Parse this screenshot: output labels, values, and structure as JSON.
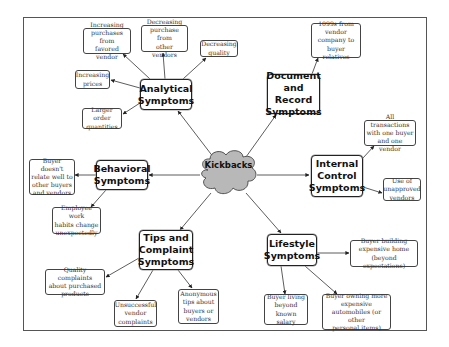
{
  "center": {
    "label": "Kickbacks",
    "fill": "#b8b8b8"
  },
  "categories": {
    "analytical": {
      "label": "Analytical\nSymptoms"
    },
    "document": {
      "label": "Document\nand Record\nSymptoms"
    },
    "internal": {
      "label": "Internal\nControl\nSymptoms"
    },
    "behavioral": {
      "label": "Behavioral\nSymptoms"
    },
    "tips": {
      "label": "Tips and\nComplaint\nSymptoms"
    },
    "lifestyle": {
      "label": "Lifestyle\nSymptoms"
    }
  },
  "leaves": {
    "increasing_purchases": "Increasing\npurchases from\nfavored vendor",
    "decreasing_purchase": "Decreasing\npurchase from\nother vendors",
    "decreasing_quality": "Decreasing\nquality",
    "increasing_prices": "Increasing\nprices",
    "larger_orders": "Larger order\nquantities",
    "form_1099s": "1099s from\nvendor\ncompany to\nbuyer relatives",
    "all_transactions": "All transactions\nwith one buyer\nand one vendor",
    "unapproved_vendors": "Use of\nunapproved\nvendors",
    "buyer_doesnt_relate": "Buyer doesn't\nrelate well to\nother buyers\nand vendors",
    "work_habits": "Employee work\nhabits change\nunexpectedly",
    "quality_complaints": "Quality complaints\nabout purchased\nproducts",
    "unsuccessful_complaints": "Unsuccessful\nvendor\ncomplaints",
    "anonymous_tips": "Anonymous\ntips about\nbuyers or\nvendors",
    "buyer_home": "Buyer building\nexpensive home\n(beyond expectations)",
    "buyer_living": "Buyer living\nbeyond\nknown salary",
    "buyer_automobiles": "Buyer owning more\nexpensive\nautomobiles (or other\npersonal items)"
  }
}
